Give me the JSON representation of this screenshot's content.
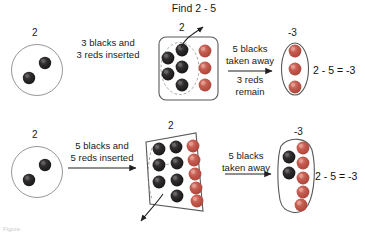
{
  "figure": {
    "title": "Find 2 - 5",
    "caption": "Figure"
  },
  "colors": {
    "black_counter": "#231f20",
    "black_counter_highlight": "#4a4648",
    "red_counter": "#c0544a",
    "red_counter_highlight": "#d4776c",
    "outline": "#58595b",
    "text": "#1a1a1a",
    "arrow": "#231f20"
  },
  "rows": [
    {
      "name": "row-one",
      "start": {
        "label": "2",
        "black_count": 2,
        "red_count": 0
      },
      "step_text": "3 blacks and\n3 reds inserted",
      "middle": {
        "label": "2",
        "black_count": 5,
        "red_count": 3
      },
      "action_text_above": "5 blacks\ntaken away",
      "action_text_below": "3 reds\nremain",
      "result": {
        "label": "-3",
        "black_count": 0,
        "red_count": 3
      },
      "equation": "2 - 5 = -3"
    },
    {
      "name": "row-two",
      "start": {
        "label": "2",
        "black_count": 2,
        "red_count": 0
      },
      "step_text": "5 blacks and\n5 reds inserted",
      "middle": {
        "label": "2",
        "black_count": 7,
        "red_count": 5
      },
      "action_text_above": "5 blacks\ntaken away",
      "action_text_below": "",
      "result": {
        "label": "-3",
        "black_count": 2,
        "red_count": 5
      },
      "equation": "2 - 5 = -3"
    }
  ]
}
